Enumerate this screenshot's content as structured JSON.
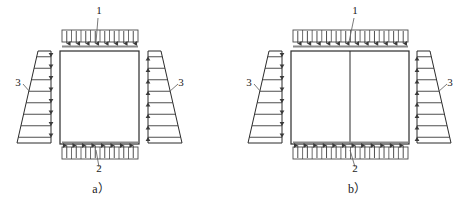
{
  "figure": {
    "background_color": "#ffffff",
    "line_color": "#2b2b2b",
    "arrow_color": "#3a3a3a",
    "edge_bar_color": "#8a8a8a",
    "width": 466,
    "height": 205
  },
  "panels": [
    {
      "id": "a",
      "caption": "a）",
      "description": "Single-cell rectangular box with uniform vertical loads and triangular lateral pressure",
      "box": {
        "x": 60,
        "y": 51,
        "width": 79,
        "height": 93,
        "cells": 1,
        "dividers": []
      },
      "top_band": {
        "label": "1",
        "label_x": 99,
        "label_y": 14,
        "x": 62,
        "y": 30,
        "width": 76,
        "height": 12,
        "arrow_count": 8,
        "direction": "down",
        "leader_from_x": 98,
        "leader_from_y": 18,
        "leader_to_x": 96,
        "leader_to_y": 42
      },
      "bottom_band": {
        "label": "2",
        "label_x": 99,
        "label_y": 172,
        "x": 62,
        "y": 147,
        "width": 76,
        "height": 12,
        "arrow_count": 8,
        "direction": "up",
        "leader_from_x": 99,
        "leader_from_y": 167,
        "leader_to_x": 96,
        "leader_to_y": 150
      },
      "left_pressure": {
        "label": "3",
        "label_x": 18,
        "label_y": 86,
        "side": "left",
        "top_x": 38,
        "bottom_x": 17,
        "edge_x": 51,
        "top_y": 51,
        "bottom_y": 143,
        "arrow_count": 8,
        "direction": "right",
        "leader_from_x": 23,
        "leader_from_y": 84,
        "leader_to_x": 30,
        "leader_to_y": 92
      },
      "right_pressure": {
        "label": "3",
        "label_x": 181,
        "label_y": 86,
        "side": "right",
        "top_x": 161,
        "bottom_x": 182,
        "edge_x": 148,
        "top_y": 51,
        "bottom_y": 143,
        "arrow_count": 8,
        "direction": "left",
        "leader_from_x": 178,
        "leader_from_y": 84,
        "leader_to_x": 169,
        "leader_to_y": 92
      },
      "caption_x": 101,
      "caption_y": 193
    },
    {
      "id": "b",
      "caption": "b）",
      "description": "Two-cell rectangular box with central divider, uniform vertical loads and triangular lateral pressure",
      "box": {
        "x": 291,
        "y": 51,
        "width": 118,
        "height": 93,
        "cells": 2,
        "dividers": [
          350
        ]
      },
      "top_band": {
        "label": "1",
        "label_x": 355,
        "label_y": 14,
        "x": 293,
        "y": 30,
        "width": 115,
        "height": 12,
        "arrow_count": 12,
        "direction": "down",
        "leader_from_x": 354,
        "leader_from_y": 18,
        "leader_to_x": 349,
        "leader_to_y": 42
      },
      "bottom_band": {
        "label": "2",
        "label_x": 355,
        "label_y": 172,
        "x": 293,
        "y": 147,
        "width": 115,
        "height": 12,
        "arrow_count": 12,
        "direction": "up",
        "leader_from_x": 355,
        "leader_from_y": 167,
        "leader_to_x": 350,
        "leader_to_y": 150
      },
      "left_pressure": {
        "label": "3",
        "label_x": 249,
        "label_y": 86,
        "side": "left",
        "top_x": 269,
        "bottom_x": 248,
        "edge_x": 282,
        "top_y": 51,
        "bottom_y": 143,
        "arrow_count": 8,
        "direction": "right",
        "leader_from_x": 254,
        "leader_from_y": 84,
        "leader_to_x": 261,
        "leader_to_y": 92
      },
      "right_pressure": {
        "label": "3",
        "label_x": 450,
        "label_y": 86,
        "side": "right",
        "top_x": 430,
        "bottom_x": 451,
        "edge_x": 417,
        "top_y": 51,
        "bottom_y": 143,
        "arrow_count": 8,
        "direction": "left",
        "leader_from_x": 447,
        "leader_from_y": 84,
        "leader_to_x": 438,
        "leader_to_y": 92
      },
      "caption_x": 357,
      "caption_y": 193
    }
  ],
  "legend": {
    "1": "Uniform load applied on top surface",
    "2": "Uniform reaction on bottom surface",
    "3": "Triangular lateral pressure distribution"
  }
}
